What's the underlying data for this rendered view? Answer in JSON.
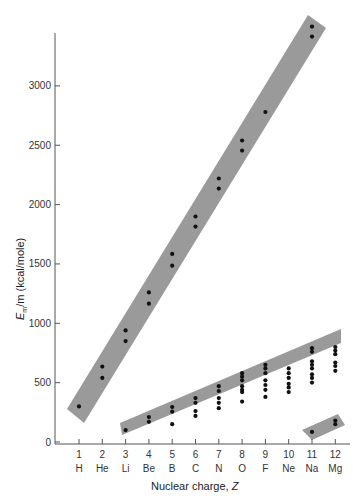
{
  "chart_data": {
    "type": "scatter",
    "title": "",
    "xlabel": "Nuclear charge, Z",
    "ylabel": "E_m/m (kcal/mole)",
    "ylabel_parts": {
      "E": "E",
      "sub": "m",
      "rest": "/m (kcal/mole)"
    },
    "xlabel_parts": {
      "text": "Nuclear charge, ",
      "var": "Z"
    },
    "ylim": [
      0,
      3500
    ],
    "xlim": [
      0.5,
      12.5
    ],
    "grid": false,
    "y_ticks": [
      0,
      500,
      1000,
      1500,
      2000,
      2500,
      3000
    ],
    "y_tick_labels": [
      "0",
      "500",
      "1000",
      "1500",
      "2000",
      "2500",
      "3000"
    ],
    "x_ticks": [
      1,
      2,
      3,
      4,
      5,
      6,
      7,
      8,
      9,
      10,
      11,
      12
    ],
    "x_tick_labels": [
      "1",
      "2",
      "3",
      "4",
      "5",
      "6",
      "7",
      "8",
      "9",
      "10",
      "11",
      "12"
    ],
    "x_element_labels": [
      "H",
      "He",
      "Li",
      "Be",
      "B",
      "C",
      "N",
      "O",
      "F",
      "Ne",
      "Na",
      "Mg"
    ],
    "series": [
      {
        "name": "upper band (innermost electrons)",
        "points": [
          [
            1,
            300
          ],
          [
            2,
            635
          ],
          [
            2,
            540
          ],
          [
            3,
            850
          ],
          [
            3,
            940
          ],
          [
            4,
            1165
          ],
          [
            4,
            1260
          ],
          [
            5,
            1485
          ],
          [
            5,
            1585
          ],
          [
            6,
            1815
          ],
          [
            6,
            1900
          ],
          [
            7,
            2135
          ],
          [
            7,
            2220
          ],
          [
            8,
            2455
          ],
          [
            8,
            2540
          ],
          [
            9,
            2780
          ],
          [
            11,
            3415
          ],
          [
            11,
            3500
          ]
        ]
      },
      {
        "name": "middle band",
        "points": [
          [
            3,
            100
          ],
          [
            4,
            210
          ],
          [
            4,
            170
          ],
          [
            5,
            295
          ],
          [
            5,
            255
          ],
          [
            5,
            150
          ],
          [
            6,
            370
          ],
          [
            6,
            330
          ],
          [
            6,
            260
          ],
          [
            6,
            220
          ],
          [
            7,
            470
          ],
          [
            7,
            430
          ],
          [
            7,
            370
          ],
          [
            7,
            330
          ],
          [
            7,
            285
          ],
          [
            8,
            580
          ],
          [
            8,
            550
          ],
          [
            8,
            520
          ],
          [
            8,
            470
          ],
          [
            8,
            440
          ],
          [
            8,
            420
          ],
          [
            8,
            340
          ],
          [
            9,
            650
          ],
          [
            9,
            620
          ],
          [
            9,
            580
          ],
          [
            9,
            520
          ],
          [
            9,
            480
          ],
          [
            9,
            440
          ],
          [
            9,
            380
          ],
          [
            10,
            620
          ],
          [
            10,
            580
          ],
          [
            10,
            540
          ],
          [
            10,
            490
          ],
          [
            10,
            460
          ],
          [
            10,
            420
          ],
          [
            11,
            790
          ],
          [
            11,
            760
          ],
          [
            11,
            680
          ],
          [
            11,
            650
          ],
          [
            11,
            620
          ],
          [
            11,
            570
          ],
          [
            11,
            540
          ],
          [
            11,
            500
          ],
          [
            12,
            800
          ],
          [
            12,
            770
          ],
          [
            12,
            740
          ],
          [
            12,
            670
          ],
          [
            12,
            640
          ],
          [
            12,
            600
          ]
        ]
      },
      {
        "name": "lower band (outermost electrons)",
        "points": [
          [
            11,
            85
          ],
          [
            12,
            180
          ],
          [
            12,
            150
          ]
        ]
      }
    ],
    "bands": [
      {
        "name": "upper-band",
        "polygon": [
          [
            67,
            409
          ],
          [
            84,
            423
          ],
          [
            326,
            28
          ],
          [
            308,
            15
          ]
        ],
        "color": "#9a9a9a"
      },
      {
        "name": "middle-band",
        "polygon": [
          [
            120,
            423
          ],
          [
            122,
            435
          ],
          [
            341,
            343
          ],
          [
            341,
            329
          ]
        ],
        "color": "#9a9a9a"
      },
      {
        "name": "lower-band",
        "polygon": [
          [
            302,
            430
          ],
          [
            312,
            440
          ],
          [
            345,
            425
          ],
          [
            338,
            414
          ]
        ],
        "color": "#9a9a9a"
      }
    ]
  },
  "colors": {
    "band": "#9a9a9a",
    "point": "#111111",
    "axis": "#555555"
  }
}
